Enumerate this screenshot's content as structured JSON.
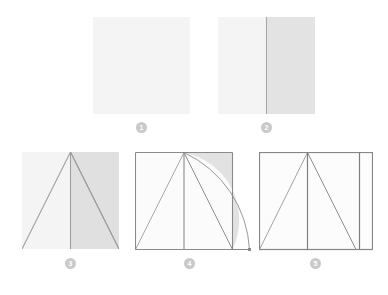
{
  "figure": {
    "type": "construction-diagram",
    "background_color": "#ffffff",
    "canvas": {
      "width": 388,
      "height": 295
    },
    "palette": {
      "fill_light": "#f5f5f5",
      "fill_shaded": "#e3e3e3",
      "fill_shaded_strong": "#dcdcdc",
      "line_light": "#c8c8c8",
      "line_dark": "#8c8c8c",
      "border_dark": "#7d7d7d",
      "badge_bg": "#c9c9c9",
      "badge_text": "#ffffff"
    },
    "steps": [
      {
        "number": "1",
        "label": "1",
        "caption_id": "step-1",
        "description": "Plain square",
        "box": {
          "x": 93,
          "y": 17,
          "w": 97,
          "h": 97
        },
        "badge": {
          "x": 136,
          "y": 122
        },
        "elements": [
          "square-outline",
          "square-fill"
        ]
      },
      {
        "number": "2",
        "label": "2",
        "caption_id": "step-2",
        "description": "Square divided by a vertical midline with right half shaded",
        "box": {
          "x": 218,
          "y": 17,
          "w": 97,
          "h": 97
        },
        "badge": {
          "x": 261,
          "y": 122
        },
        "midline_fraction": 0.5,
        "elements": [
          "square-fill",
          "vertical-midline",
          "right-half-shaded"
        ]
      },
      {
        "number": "3",
        "label": "3",
        "caption_id": "step-3",
        "description": "Square with vertical midline and inscribed triangle from base corners to top midpoint",
        "box": {
          "x": 22,
          "y": 152,
          "w": 97,
          "h": 97
        },
        "badge": {
          "x": 65,
          "y": 258
        },
        "midline_fraction": 0.5,
        "elements": [
          "square-fill",
          "right-half-shaded",
          "vertical-midline",
          "triangle-left-leg",
          "triangle-right-leg"
        ]
      },
      {
        "number": "4",
        "label": "4",
        "caption_id": "step-4",
        "description": "Square with outline, midline, triangle, and an arc swung from the apex down past the right edge",
        "box": {
          "x": 135,
          "y": 152,
          "w": 97,
          "h": 97
        },
        "badge": {
          "x": 184,
          "y": 258
        },
        "midline_fraction": 0.5,
        "arc_end_x_overshoot": 17,
        "elements": [
          "square-outline",
          "vertical-midline",
          "triangle-left-leg",
          "triangle-right-leg",
          "arc",
          "shaded-arc-sector",
          "extended-baseline"
        ]
      },
      {
        "number": "5",
        "label": "5",
        "caption_id": "step-5",
        "description": "Extended rectangle with outline, midline of the original square, triangle, and new right-hand vertical division",
        "box": {
          "x": 259,
          "y": 152,
          "w": 114,
          "h": 97
        },
        "badge": {
          "x": 310,
          "y": 258
        },
        "midline_fraction": 0.425,
        "second_division_x": 101,
        "elements": [
          "rectangle-outline",
          "vertical-midline",
          "triangle-left-leg",
          "triangle-right-leg",
          "right-vertical-division"
        ]
      }
    ]
  }
}
